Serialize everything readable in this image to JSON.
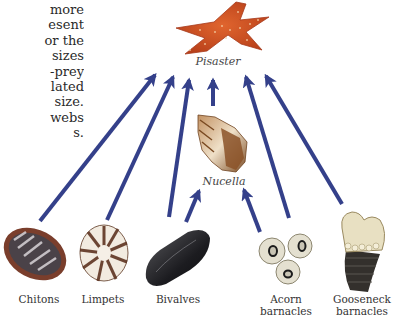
{
  "text_fragment": {
    "lines": [
      "more",
      "esent",
      "or the",
      "sizes",
      "-prey",
      "lated",
      "size.",
      "webs",
      "s."
    ]
  },
  "nodes": {
    "pisaster": {
      "label": "Pisaster",
      "icon": "starfish-icon",
      "color": "#c8461e"
    },
    "nucella": {
      "label": "Nucella",
      "icon": "whelk-snail-icon",
      "color": "#8a5a30"
    },
    "chitons": {
      "label": "Chitons",
      "icon": "chiton-icon"
    },
    "limpets": {
      "label": "Limpets",
      "icon": "limpet-icon"
    },
    "bivalves": {
      "label": "Bivalves",
      "icon": "mussel-icon"
    },
    "acorn_barnacles": {
      "label_line1": "Acorn",
      "label_line2": "barnacles",
      "icon": "acorn-barnacle-icon"
    },
    "gooseneck_barnacles": {
      "label_line1": "Gooseneck",
      "label_line2": "barnacles",
      "icon": "gooseneck-barnacle-icon"
    }
  },
  "edges": [
    {
      "from": "chitons",
      "to": "pisaster"
    },
    {
      "from": "limpets",
      "to": "pisaster"
    },
    {
      "from": "bivalves",
      "to": "pisaster"
    },
    {
      "from": "nucella",
      "to": "pisaster"
    },
    {
      "from": "acorn_barnacles",
      "to": "pisaster"
    },
    {
      "from": "gooseneck_barnacles",
      "to": "pisaster"
    },
    {
      "from": "bivalves",
      "to": "nucella"
    },
    {
      "from": "acorn_barnacles",
      "to": "nucella"
    }
  ],
  "colors": {
    "arrow": "#34408a",
    "background": "#ffffff"
  }
}
